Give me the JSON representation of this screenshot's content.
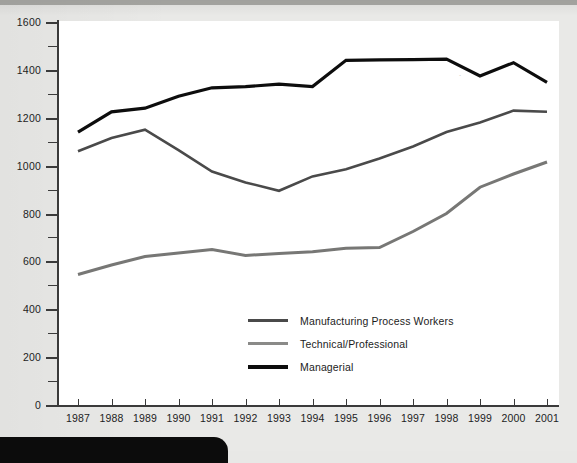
{
  "chart_data": {
    "type": "line",
    "title": "",
    "subtitle": "",
    "xlabel": "",
    "ylabel": "",
    "grid": false,
    "legend_position": "inside-center",
    "categories": [
      "1987",
      "1988",
      "1989",
      "1990",
      "1991",
      "1992",
      "1993",
      "1994",
      "1995",
      "1996",
      "1997",
      "1998",
      "1999",
      "2000",
      "2001"
    ],
    "xlim": [
      "1987",
      "2001"
    ],
    "ylim": [
      0,
      1600
    ],
    "ytick_values": [
      0,
      200,
      400,
      600,
      800,
      1000,
      1200,
      1400,
      1600
    ],
    "ytick_labels": [
      "0",
      "200",
      "400",
      "600",
      "800",
      "1000",
      "1200",
      "1400",
      "1600"
    ],
    "yminor_values": [
      100,
      300,
      500,
      700,
      900,
      1100,
      1300,
      1500
    ],
    "series": [
      {
        "name": "Manufacturing Process Workers",
        "color": "#4a4a4a",
        "width": 2.6,
        "values": [
          1060,
          1115,
          1150,
          1065,
          975,
          930,
          895,
          955,
          985,
          1030,
          1080,
          1140,
          1180,
          1230,
          1225
        ]
      },
      {
        "name": "Technical/Professional",
        "color": "#777775",
        "width": 3.0,
        "values": [
          545,
          585,
          620,
          635,
          650,
          625,
          633,
          640,
          655,
          658,
          725,
          800,
          910,
          965,
          1015
        ]
      },
      {
        "name": "Managerial",
        "color": "#0d0d0d",
        "width": 3.2,
        "values": [
          1140,
          1225,
          1240,
          1290,
          1325,
          1330,
          1340,
          1330,
          1440,
          1442,
          1443,
          1445,
          1375,
          1430,
          1348
        ]
      }
    ]
  },
  "legend": {
    "items": [
      {
        "label": "Manufacturing Process Workers",
        "color": "#4a4a4a",
        "thickness": 3
      },
      {
        "label": "Technical/Professional",
        "color": "#8a8a88",
        "thickness": 3
      },
      {
        "label": "Managerial",
        "color": "#0d0d0d",
        "thickness": 4
      }
    ]
  },
  "page": {
    "background_color": "#e9e9e7",
    "plot_background_color": "#ffffff",
    "axis_color": "#3a3a3a",
    "bottom_bar_color": "#0c0c0c",
    "speck_mark": "´"
  }
}
